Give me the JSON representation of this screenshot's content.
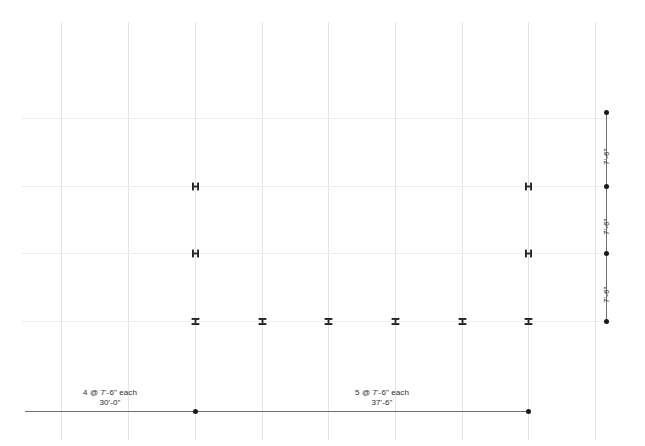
{
  "drawing": {
    "title": "Structural Framing Grid Elevation",
    "background_color": "#ffffff",
    "grid_color": "#e4e4e4",
    "grid_color_horizontal": "#ededed",
    "dimension_line_color": "#6f6f6f",
    "dimension_dot_color": "#1a1a1a",
    "marker_color": "#222222",
    "text_color": "#2b2b2b"
  },
  "grid": {
    "vertical_lines_x": [
      61,
      128,
      195,
      262,
      328,
      395,
      462,
      528,
      595
    ],
    "vertical_span_y": [
      22,
      440
    ],
    "horizontal_lines_y": [
      118,
      186,
      253,
      321
    ],
    "horizontal_span_x": [
      22,
      612
    ]
  },
  "markers": {
    "columns": [
      {
        "name": "column-H-left-upper",
        "x": 195,
        "y": 186,
        "glyph": "H"
      },
      {
        "name": "column-H-left-lower",
        "x": 195,
        "y": 253,
        "glyph": "H"
      },
      {
        "name": "column-H-right-upper",
        "x": 528,
        "y": 186,
        "glyph": "H"
      },
      {
        "name": "column-H-right-lower",
        "x": 528,
        "y": 253,
        "glyph": "H"
      }
    ],
    "beams": [
      {
        "name": "beam-I-1",
        "x": 195,
        "y": 321,
        "glyph": "I"
      },
      {
        "name": "beam-I-2",
        "x": 262,
        "y": 321,
        "glyph": "I"
      },
      {
        "name": "beam-I-3",
        "x": 328,
        "y": 321,
        "glyph": "I"
      },
      {
        "name": "beam-I-4",
        "x": 395,
        "y": 321,
        "glyph": "I"
      },
      {
        "name": "beam-I-5",
        "x": 462,
        "y": 321,
        "glyph": "I"
      },
      {
        "name": "beam-I-6",
        "x": 528,
        "y": 321,
        "glyph": "I"
      }
    ]
  },
  "dimensions": {
    "horizontal": {
      "line_y": 411,
      "line_x_start": 25,
      "line_x_end": 528,
      "dots_x": [
        195,
        528
      ],
      "segments": [
        {
          "name": "dim-bay-left",
          "center_x": 110,
          "count_label": "4 @ 7'-6\" each",
          "total_label": "30'-0\"",
          "count": 4,
          "spacing": "7'-6\"",
          "total": "30'-0\""
        },
        {
          "name": "dim-bay-right",
          "center_x": 382,
          "count_label": "5 @ 7'-6\" each",
          "total_label": "37'-6\"",
          "count": 5,
          "spacing": "7'-6\"",
          "total": "37'-6\""
        }
      ]
    },
    "vertical": {
      "line_x": 606,
      "line_y_start": 112,
      "line_y_end": 321,
      "dots_y": [
        112,
        186,
        253,
        321
      ],
      "segments": [
        {
          "name": "dim-story-top",
          "label": "7'-6\"",
          "mid_y": 149,
          "value": "7'-6\""
        },
        {
          "name": "dim-story-middle",
          "label": "7'-6\"",
          "mid_y": 219,
          "value": "7'-6\""
        },
        {
          "name": "dim-story-bottom",
          "label": "7'-6\"",
          "mid_y": 287,
          "value": "7'-6\""
        }
      ]
    }
  }
}
